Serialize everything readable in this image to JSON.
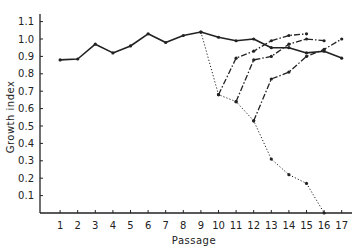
{
  "chart_data": {
    "type": "line",
    "title": "",
    "xlabel": "Passage",
    "ylabel": "Growth index",
    "x": [
      1,
      2,
      3,
      4,
      5,
      6,
      7,
      8,
      9,
      10,
      11,
      12,
      13,
      14,
      15,
      16,
      17
    ],
    "xlim": [
      0,
      17.5
    ],
    "ylim": [
      0,
      1.12
    ],
    "yticks": [
      0.1,
      0.2,
      0.3,
      0.4,
      0.5,
      0.6,
      0.7,
      0.8,
      0.9,
      1.0,
      1.1
    ],
    "ytick_labels": [
      "0.1",
      "0.2",
      "0.3",
      "0.4",
      "0.5",
      "0.6",
      "0.7",
      "0.8",
      "0.9",
      "1.0",
      "1.1"
    ],
    "xtick_labels": [
      "1",
      "2",
      "3",
      "4",
      "5",
      "6",
      "7",
      "8",
      "9",
      "10",
      "11",
      "12",
      "13",
      "14",
      "15",
      "16",
      "17"
    ],
    "grid": false,
    "legend": null,
    "series": [
      {
        "name": "control",
        "style": "solid",
        "x": [
          1,
          2,
          3,
          4,
          5,
          6,
          7,
          8,
          9,
          10,
          11,
          12,
          13,
          14,
          15,
          16,
          17
        ],
        "values": [
          0.88,
          0.885,
          0.97,
          0.92,
          0.96,
          1.03,
          0.98,
          1.02,
          1.04,
          1.01,
          0.99,
          1.0,
          0.95,
          0.95,
          0.92,
          0.93,
          0.89
        ]
      },
      {
        "name": "treated",
        "style": "dotted",
        "x": [
          9,
          10,
          11,
          12,
          13,
          14,
          15,
          16
        ],
        "values": [
          1.04,
          0.68,
          0.64,
          0.53,
          0.31,
          0.22,
          0.17,
          0.0
        ]
      },
      {
        "name": "recovery from passage 10",
        "style": "dashdot",
        "x": [
          10,
          11,
          12,
          13,
          14,
          15
        ],
        "values": [
          0.68,
          0.89,
          0.93,
          0.99,
          1.02,
          1.03
        ]
      },
      {
        "name": "recovery from passage 11",
        "style": "dashdot",
        "x": [
          11,
          12,
          13,
          14,
          15,
          16
        ],
        "values": [
          0.64,
          0.88,
          0.9,
          0.97,
          1.0,
          0.99
        ]
      },
      {
        "name": "recovery from passage 12",
        "style": "dashdot",
        "x": [
          12,
          13,
          14,
          15,
          16,
          17
        ],
        "values": [
          0.53,
          0.77,
          0.81,
          0.9,
          0.94,
          1.0
        ]
      }
    ]
  },
  "colors": {
    "ink": "#222222",
    "background": "#ffffff"
  }
}
